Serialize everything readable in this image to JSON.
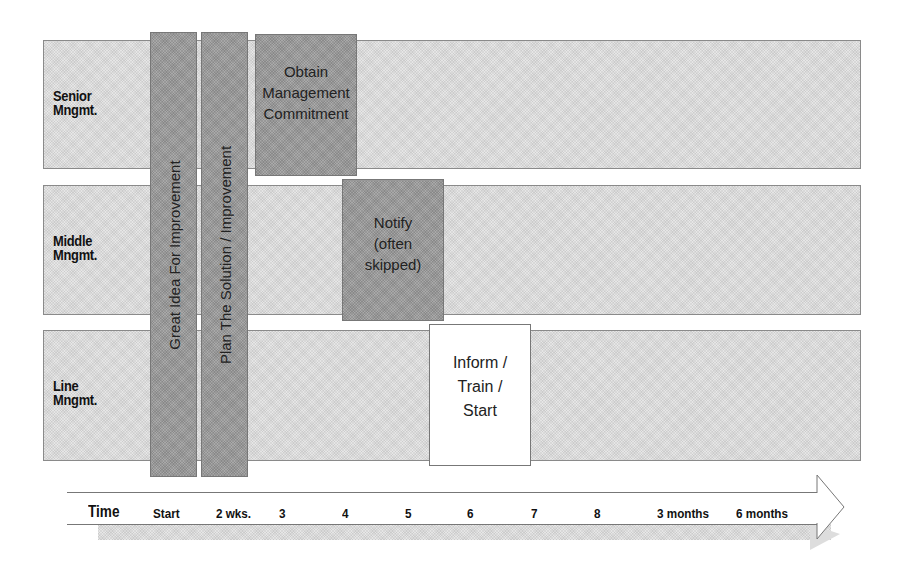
{
  "lanes": [
    {
      "label_line1": "Senior",
      "label_line2": "Mngmt."
    },
    {
      "label_line1": "Middle",
      "label_line2": "Mngmt."
    },
    {
      "label_line1": "Line",
      "label_line2": "Mngmt."
    }
  ],
  "vertical_bars": [
    {
      "label": "Great Idea For Improvement"
    },
    {
      "label": "Plan The Solution / Improvement"
    }
  ],
  "steps": [
    {
      "label": "Obtain\nManagement\nCommitment",
      "lane": "Senior Mngmt."
    },
    {
      "label": "Notify\n(often\nskipped)",
      "lane": "Middle Mngmt."
    },
    {
      "label": "Inform /\nTrain /\nStart",
      "lane": "Line Mngmt."
    }
  ],
  "timeline": {
    "title": "Time",
    "ticks": [
      "Start",
      "2 wks.",
      "3",
      "4",
      "5",
      "6",
      "7",
      "8",
      "3 months",
      "6 months"
    ]
  },
  "colors": {
    "lane_fill": "#e6e6e6",
    "step_fill": "#a9a9a9",
    "final_step_fill": "#ffffff",
    "border": "#777777"
  }
}
